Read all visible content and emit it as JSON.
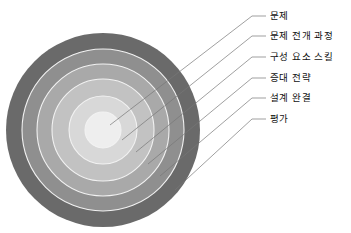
{
  "diagram": {
    "type": "concentric-rings",
    "title": "",
    "background_color": "#ffffff",
    "center": {
      "x": 103,
      "y": 130
    },
    "rings": [
      {
        "index": 1,
        "label": "문제",
        "color": "#eeeeee",
        "radius": 18,
        "label_y": 16,
        "leader_anchor": {
          "x": 110,
          "y": 125
        }
      },
      {
        "index": 2,
        "label": "문제 전개 과정",
        "color": "#d8d8d8",
        "radius": 34,
        "label_y": 36,
        "leader_anchor": {
          "x": 122,
          "y": 140
        }
      },
      {
        "index": 3,
        "label": "구성 요소 스킬",
        "color": "#c2c2c2",
        "radius": 51,
        "label_y": 57,
        "leader_anchor": {
          "x": 136,
          "y": 152
        }
      },
      {
        "index": 4,
        "label": "증대 전략",
        "color": "#a9a9a9",
        "radius": 66,
        "label_y": 78,
        "leader_anchor": {
          "x": 148,
          "y": 164
        }
      },
      {
        "index": 5,
        "label": "설계 완결",
        "color": "#8f8f8f",
        "radius": 81,
        "label_y": 98,
        "leader_anchor": {
          "x": 160,
          "y": 176
        }
      },
      {
        "index": 6,
        "label": "평가",
        "color": "#6a6a6a",
        "radius": 97,
        "label_y": 119,
        "leader_anchor": {
          "x": 175,
          "y": 190
        }
      }
    ],
    "leader_lines": {
      "color": "#777777",
      "width": 0.7,
      "dash_x_start": 252,
      "dash_x_end": 266,
      "elbow_x": 252
    },
    "ring_separator": {
      "color": "#f2f2f2",
      "width": 1.1
    }
  }
}
